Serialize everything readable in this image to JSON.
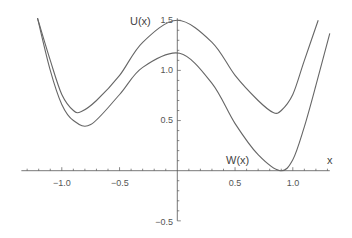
{
  "chart_data": {
    "type": "line",
    "title": "",
    "xlabel": "x",
    "ylabel": "",
    "xlim": [
      -1.35,
      1.32
    ],
    "ylim": [
      -0.5,
      1.52
    ],
    "grid": false,
    "legend": "none (curves labeled inline)",
    "x_ticks": [
      "-1.0",
      "-0.5",
      "0.5",
      "1.0"
    ],
    "y_ticks": [
      "1.5",
      "1.0",
      "0.5",
      "-0.5"
    ],
    "annotations": [
      {
        "text": "U(x)",
        "x": -0.2,
        "y": 1.45
      },
      {
        "text": "W(x)",
        "x": 0.62,
        "y": 0.06
      },
      {
        "text": "x",
        "x": 1.27,
        "y": 0.06
      }
    ],
    "series": [
      {
        "name": "U(x)",
        "x": [
          -1.21,
          -1.1,
          -1.0,
          -0.9,
          -0.83,
          -0.7,
          -0.5,
          -0.3,
          0.0,
          0.3,
          0.5,
          0.7,
          0.83,
          0.9,
          1.0,
          1.1,
          1.22
        ],
        "values": [
          1.52,
          1.1,
          0.76,
          0.6,
          0.59,
          0.7,
          0.95,
          1.28,
          1.5,
          1.28,
          0.95,
          0.7,
          0.58,
          0.6,
          0.76,
          1.1,
          1.5
        ]
      },
      {
        "name": "W(x)",
        "x": [
          -1.21,
          -1.1,
          -1.0,
          -0.9,
          -0.75,
          -0.5,
          -0.3,
          0.02,
          0.3,
          0.5,
          0.7,
          0.89,
          1.0,
          1.1,
          1.2,
          1.32
        ],
        "values": [
          1.52,
          1.0,
          0.66,
          0.5,
          0.46,
          0.76,
          1.03,
          1.17,
          0.87,
          0.47,
          0.16,
          0.0,
          0.11,
          0.44,
          0.85,
          1.37
        ]
      }
    ]
  }
}
